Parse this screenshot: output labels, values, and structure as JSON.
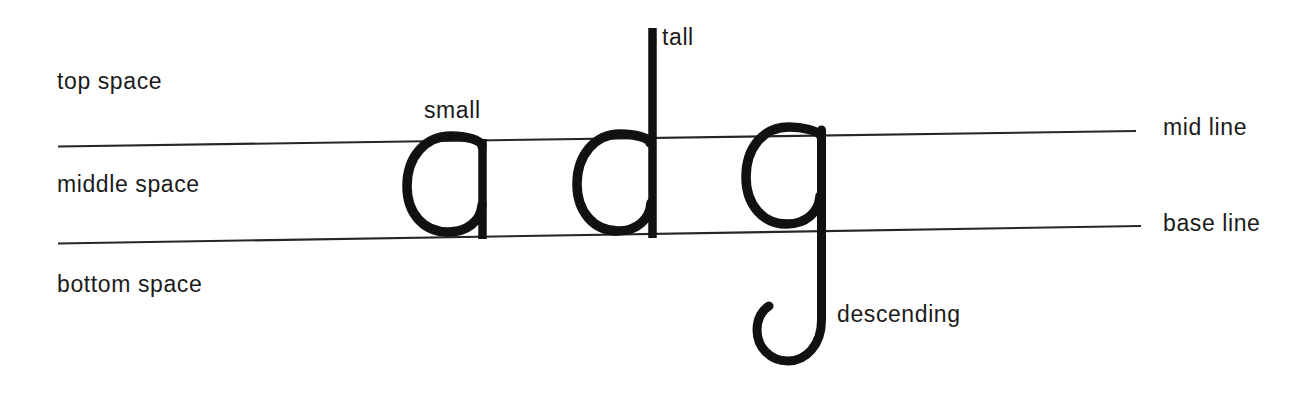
{
  "diagram": {
    "background_color": "#ffffff",
    "ink_color": "#111111",
    "rule_color": "#2b2b2b",
    "labels": {
      "top_space": "top space",
      "middle_space": "middle space",
      "bottom_space": "bottom space",
      "mid_line": "mid line",
      "base_line": "base line",
      "small": "small",
      "tall": "tall",
      "descending": "descending"
    },
    "letters": [
      {
        "glyph": "a",
        "class": "small",
        "note": "sits between mid line and base line"
      },
      {
        "glyph": "d",
        "class": "tall",
        "note": "ascender rises above mid line"
      },
      {
        "glyph": "g",
        "class": "descending",
        "note": "descender drops below base line"
      }
    ],
    "rules": [
      {
        "name": "mid line",
        "left_y": 146,
        "right_y": 131,
        "x_start": 58,
        "x_end": 1136
      },
      {
        "name": "base line",
        "left_y": 243,
        "right_y": 226,
        "x_start": 58,
        "x_end": 1141
      }
    ]
  }
}
